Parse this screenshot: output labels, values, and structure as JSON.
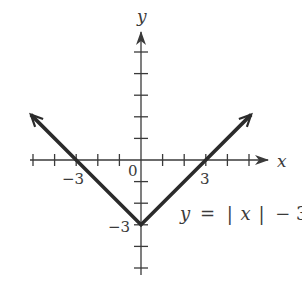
{
  "chart_data": {
    "type": "line",
    "title": "",
    "equation_label": "y = |x| − 3",
    "equation_parts": {
      "lhs": "y",
      "eq": "=",
      "bar_l": "|",
      "var": "x",
      "bar_r": "|",
      "rest": "− 3"
    },
    "xlabel": "x",
    "ylabel": "y",
    "xlim": [
      -5.2,
      6
    ],
    "ylim": [
      -5,
      5.5
    ],
    "grid": false,
    "x_ticks": [
      -5,
      -4,
      -3,
      -2,
      -1,
      1,
      2,
      3,
      4,
      5
    ],
    "y_ticks": [
      -5,
      -4,
      -3,
      -2,
      -1,
      1,
      2,
      3,
      4,
      5
    ],
    "tick_labels": {
      "x": [
        {
          "value": -3,
          "label": "−3"
        },
        {
          "value": 3,
          "label": "3"
        }
      ],
      "y": [
        {
          "value": -3,
          "label": "−3"
        }
      ],
      "origin": "0"
    },
    "series": [
      {
        "name": "y = |x| − 3",
        "x": [
          -5,
          -3,
          0,
          3,
          5
        ],
        "y": [
          2,
          0,
          -3,
          0,
          2
        ],
        "arrows_at_ends": true
      }
    ],
    "key_points": {
      "vertex": [
        0,
        -3
      ],
      "x_intercepts": [
        [
          -3,
          0
        ],
        [
          3,
          0
        ]
      ],
      "y_intercept": [
        0,
        -3
      ]
    }
  }
}
